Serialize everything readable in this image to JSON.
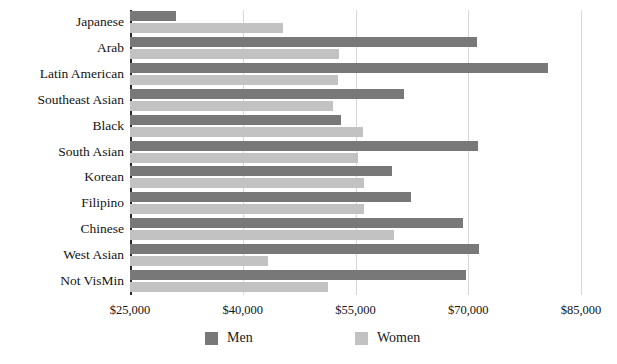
{
  "chart_data": {
    "type": "bar",
    "orientation": "horizontal",
    "title": "",
    "subtitle": "",
    "xlabel": "",
    "ylabel": "",
    "xlim": [
      25000,
      85000
    ],
    "xtick_labels": [
      "$25,000",
      "$40,000",
      "$55,000",
      "$70,000",
      "$85,000"
    ],
    "xticks": [
      25000,
      40000,
      55000,
      70000,
      85000
    ],
    "grid": true,
    "legend_position": "bottom",
    "categories": [
      "Japanese",
      "Arab",
      "Latin American",
      "Southeast Asian",
      "Black",
      "South Asian",
      "Korean",
      "Filipino",
      "Chinese",
      "West Asian",
      "Not VisMin"
    ],
    "series": [
      {
        "name": "Men",
        "color": "#787878",
        "values": [
          31100,
          71100,
          80600,
          61500,
          53100,
          71300,
          59800,
          62400,
          69300,
          71400,
          69700
        ]
      },
      {
        "name": "Women",
        "color": "#c2c2c2",
        "values": [
          45400,
          52800,
          52700,
          52000,
          56000,
          55300,
          56100,
          56100,
          60100,
          43400,
          51400
        ]
      }
    ]
  },
  "legend": {
    "items": [
      {
        "label": "Men",
        "swatch": "men-color-swatch"
      },
      {
        "label": "Women",
        "swatch": "women-color-swatch"
      }
    ]
  },
  "colors": {
    "men": "#787878",
    "women": "#c2c2c2",
    "axis": "#2a2a2a",
    "gridline": "#d8d8d8",
    "background": "#ffffff",
    "text": "#141414"
  }
}
